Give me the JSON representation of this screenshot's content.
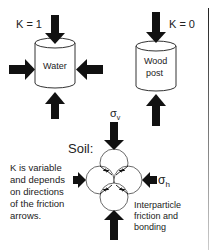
{
  "water_case": {
    "k_label": "K = 1",
    "material": "Water"
  },
  "wood_case": {
    "k_label": "K = 0",
    "material_line1": "Wood",
    "material_line2": "post"
  },
  "soil_case": {
    "title": "Soil:",
    "sigma_v": "σ",
    "sigma_v_sub": "v",
    "sigma_h": "σ",
    "sigma_h_sub": "h",
    "explanation": [
      "K is variable",
      "and depends",
      "on directions",
      "of the friction",
      "arrows."
    ],
    "friction_label": [
      "Interparticle",
      "friction and",
      "bonding"
    ]
  },
  "colors": {
    "arrow": "#111111",
    "outline": "#333333",
    "text": "#222222"
  }
}
